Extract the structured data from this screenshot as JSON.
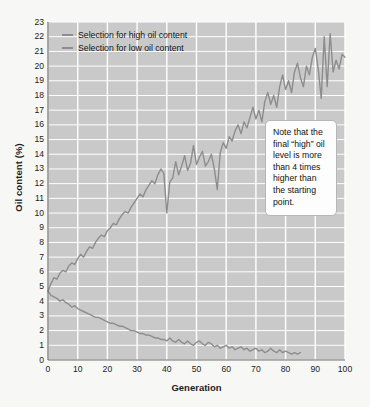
{
  "chart_data": {
    "type": "line",
    "title": "",
    "xlabel": "Generation",
    "ylabel": "Oil content (%)",
    "xlim": [
      0,
      100
    ],
    "ylim": [
      0,
      23
    ],
    "xticks": [
      0,
      10,
      20,
      30,
      40,
      50,
      60,
      70,
      80,
      90,
      100
    ],
    "yticks": [
      0,
      1,
      2,
      3,
      4,
      5,
      6,
      7,
      8,
      9,
      10,
      11,
      12,
      13,
      14,
      15,
      16,
      17,
      18,
      19,
      20,
      21,
      22,
      23
    ],
    "grid": true,
    "legend_position": "top-left",
    "plot_background": "#c9c9c9",
    "grid_color": "#ffffff",
    "line_color": "#8d8d8d",
    "series": [
      {
        "name": "Selection for high oil content",
        "x": [
          0,
          1,
          2,
          3,
          4,
          5,
          6,
          7,
          8,
          9,
          10,
          11,
          12,
          13,
          14,
          15,
          16,
          17,
          18,
          19,
          20,
          21,
          22,
          23,
          24,
          25,
          26,
          27,
          28,
          29,
          30,
          31,
          32,
          33,
          34,
          35,
          36,
          37,
          38,
          39,
          40,
          41,
          42,
          43,
          44,
          45,
          46,
          47,
          48,
          49,
          50,
          51,
          52,
          53,
          54,
          55,
          56,
          57,
          58,
          59,
          60,
          61,
          62,
          63,
          64,
          65,
          66,
          67,
          68,
          69,
          70,
          71,
          72,
          73,
          74,
          75,
          76,
          77,
          78,
          79,
          80,
          81,
          82,
          83,
          84,
          85,
          86,
          87,
          88,
          89,
          90,
          91,
          92,
          93,
          94,
          95,
          96,
          97,
          98,
          99,
          100
        ],
        "values": [
          4.7,
          5.2,
          5.6,
          5.5,
          5.9,
          6.1,
          6.0,
          6.4,
          6.6,
          6.5,
          6.9,
          7.2,
          7.0,
          7.4,
          7.7,
          7.6,
          8.0,
          8.3,
          8.5,
          8.4,
          8.8,
          9.0,
          9.3,
          9.2,
          9.6,
          9.9,
          10.1,
          10.0,
          10.4,
          10.7,
          11.0,
          11.3,
          11.1,
          11.6,
          11.9,
          12.2,
          12.0,
          12.6,
          13.0,
          12.7,
          10.0,
          12.1,
          12.4,
          13.5,
          12.6,
          13.2,
          13.9,
          12.9,
          13.4,
          14.6,
          13.3,
          13.8,
          14.2,
          13.2,
          13.5,
          14.0,
          13.0,
          11.6,
          14.1,
          14.8,
          14.4,
          15.2,
          14.9,
          15.6,
          16.0,
          15.4,
          16.2,
          15.8,
          16.5,
          17.2,
          16.4,
          17.0,
          16.2,
          17.6,
          18.2,
          17.4,
          18.0,
          17.2,
          18.6,
          19.4,
          18.4,
          19.0,
          18.2,
          19.6,
          20.2,
          19.2,
          18.6,
          20.0,
          19.4,
          20.6,
          21.2,
          19.8,
          17.8,
          22.0,
          18.6,
          22.2,
          19.6,
          20.4,
          19.8,
          20.8,
          20.6
        ]
      },
      {
        "name": "Selection for low oil content",
        "x": [
          0,
          1,
          2,
          3,
          4,
          5,
          6,
          7,
          8,
          9,
          10,
          11,
          12,
          13,
          14,
          15,
          16,
          17,
          18,
          19,
          20,
          21,
          22,
          23,
          24,
          25,
          26,
          27,
          28,
          29,
          30,
          31,
          32,
          33,
          34,
          35,
          36,
          37,
          38,
          39,
          40,
          41,
          42,
          43,
          44,
          45,
          46,
          47,
          48,
          49,
          50,
          51,
          52,
          53,
          54,
          55,
          56,
          57,
          58,
          59,
          60,
          61,
          62,
          63,
          64,
          65,
          66,
          67,
          68,
          69,
          70,
          71,
          72,
          73,
          74,
          75,
          76,
          77,
          78,
          79,
          80,
          81,
          82,
          83,
          84,
          85
        ],
        "values": [
          4.7,
          4.4,
          4.3,
          4.2,
          4.0,
          4.1,
          3.9,
          3.8,
          3.6,
          3.7,
          3.5,
          3.4,
          3.3,
          3.2,
          3.1,
          3.0,
          2.9,
          2.9,
          2.8,
          2.7,
          2.6,
          2.5,
          2.5,
          2.4,
          2.3,
          2.3,
          2.2,
          2.1,
          2.0,
          2.0,
          1.9,
          1.8,
          1.8,
          1.7,
          1.7,
          1.6,
          1.5,
          1.5,
          1.4,
          1.4,
          1.3,
          1.5,
          1.3,
          1.2,
          1.4,
          1.2,
          1.1,
          1.3,
          1.1,
          1.0,
          1.2,
          1.3,
          1.1,
          1.0,
          1.2,
          1.1,
          0.9,
          1.0,
          0.8,
          0.9,
          1.0,
          0.8,
          0.9,
          0.7,
          0.8,
          0.9,
          0.7,
          0.8,
          0.6,
          0.7,
          0.8,
          0.6,
          0.7,
          0.5,
          0.6,
          0.8,
          0.6,
          0.5,
          0.7,
          0.5,
          0.6,
          0.5,
          0.4,
          0.5,
          0.4,
          0.5
        ]
      }
    ],
    "annotations": [
      {
        "text": "Note that the final “high” oil level is more than 4 times higher than the starting point."
      }
    ]
  },
  "legend": {
    "items": [
      {
        "label": "Selection for high oil content"
      },
      {
        "label": "Selection for low oil content"
      }
    ]
  }
}
